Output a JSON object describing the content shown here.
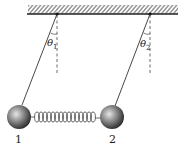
{
  "diagram": {
    "title": "",
    "ceiling": {
      "type": "hatched-support"
    },
    "pendulums": [
      {
        "id": "1",
        "label": "1",
        "angle_label": "θ",
        "angle_sub": "1"
      },
      {
        "id": "2",
        "label": "2",
        "angle_label": "θ",
        "angle_sub": "2"
      }
    ],
    "spring": {
      "connects": [
        "1",
        "2"
      ]
    },
    "colors": {
      "line": "#333333",
      "ball_light": "#d9d9d9",
      "ball_dark": "#2a2a2a"
    }
  }
}
